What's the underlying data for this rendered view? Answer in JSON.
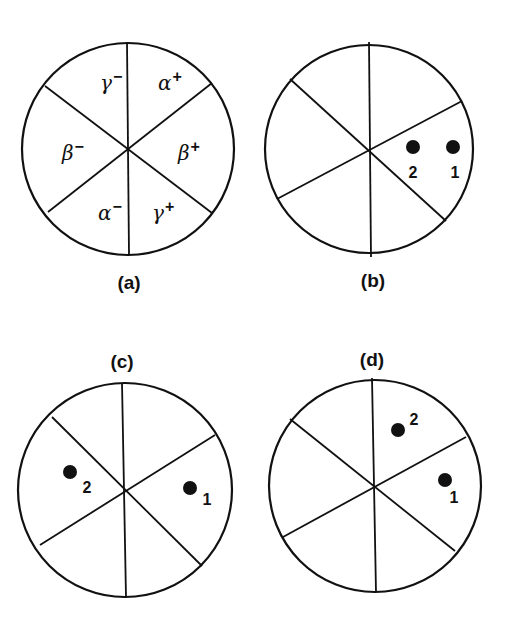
{
  "figure": {
    "panels": [
      {
        "id": "a",
        "caption": "(a)",
        "center": [
          128,
          149
        ],
        "radius": 106,
        "spokes": [
          [
            127,
            42,
            129,
            255
          ],
          [
            45,
            86,
            212,
            213
          ],
          [
            48,
            212,
            212,
            83
          ]
        ],
        "caption_pos": [
          129,
          289
        ],
        "sector_labels": [
          {
            "greek": "γ",
            "sign": "−",
            "x": 100,
            "y": 90
          },
          {
            "greek": "α",
            "sign": "+",
            "x": 158,
            "y": 90
          },
          {
            "greek": "β",
            "sign": "−",
            "x": 62,
            "y": 160
          },
          {
            "greek": "β",
            "sign": "+",
            "x": 178,
            "y": 160
          },
          {
            "greek": "α",
            "sign": "−",
            "x": 98,
            "y": 220
          },
          {
            "greek": "γ",
            "sign": "+",
            "x": 152,
            "y": 220
          }
        ],
        "points": []
      },
      {
        "id": "b",
        "caption": "(b)",
        "center": [
          369,
          149
        ],
        "radius": 104,
        "spokes": [
          [
            369,
            42,
            371,
            257
          ],
          [
            290,
            79,
            446,
            221
          ],
          [
            277,
            199,
            462,
            101
          ]
        ],
        "caption_pos": [
          373,
          287
        ],
        "sector_labels": [],
        "points": [
          {
            "label": "2",
            "x": 413,
            "y": 147,
            "lx": 413,
            "ly": 178
          },
          {
            "label": "1",
            "x": 453,
            "y": 147,
            "lx": 455,
            "ly": 178
          }
        ]
      },
      {
        "id": "c",
        "caption": "(c)",
        "center": [
          125,
          490
        ],
        "radius": 107,
        "spokes": [
          [
            122,
            383,
            126,
            597
          ],
          [
            52,
            417,
            202,
            566
          ],
          [
            40,
            545,
            215,
            435
          ]
        ],
        "caption_pos": [
          122,
          368
        ],
        "sector_labels": [],
        "points": [
          {
            "label": "2",
            "x": 70,
            "y": 472,
            "lx": 87,
            "ly": 493
          },
          {
            "label": "1",
            "x": 190,
            "y": 488,
            "lx": 207,
            "ly": 505
          }
        ]
      },
      {
        "id": "d",
        "caption": "(d)",
        "center": [
          375,
          486
        ],
        "radius": 106,
        "spokes": [
          [
            372,
            378,
            376,
            592
          ],
          [
            290,
            419,
            455,
            551
          ],
          [
            283,
            537,
            466,
            437
          ]
        ],
        "caption_pos": [
          372,
          366
        ],
        "sector_labels": [],
        "points": [
          {
            "label": "2",
            "x": 398,
            "y": 430,
            "lx": 414,
            "ly": 425
          },
          {
            "label": "1",
            "x": 445,
            "y": 480,
            "lx": 454,
            "ly": 503
          }
        ]
      }
    ]
  }
}
